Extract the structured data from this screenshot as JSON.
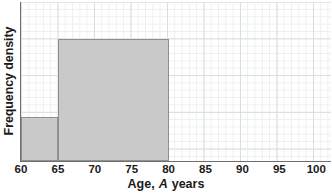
{
  "chart_data": {
    "type": "bar",
    "title": "",
    "subtitle": "",
    "xlabel_prefix": "Age,",
    "xlabel_variable": "A",
    "xlabel_suffix": "years",
    "xlabel": "Age, A years",
    "ylabel": "Frequency density",
    "grid": true,
    "legend": "none",
    "xlim": [
      60,
      102
    ],
    "ylim": [
      0,
      1.3
    ],
    "xticks": [
      60,
      65,
      70,
      75,
      80,
      85,
      90,
      95,
      100
    ],
    "xtick_labels": [
      "60",
      "65",
      "70",
      "75",
      "80",
      "85",
      "90",
      "95",
      "100"
    ],
    "ytick_labels": [],
    "bar_fill_color": "#c9c9c9",
    "bar_edge_color": "#8f8f8f",
    "axis_color": "#6e6e6e",
    "grid_major_color": "#d8dee2",
    "grid_minor_color": "#eceff1",
    "bins": [
      {
        "label": "60-65",
        "x_start": 60,
        "x_end": 65,
        "frequency_density": 0.36
      },
      {
        "label": "65-80",
        "x_start": 65,
        "x_end": 80,
        "frequency_density": 1.0
      }
    ],
    "categories": [
      "60-65",
      "65-80"
    ],
    "values": [
      0.36,
      1.0
    ]
  }
}
